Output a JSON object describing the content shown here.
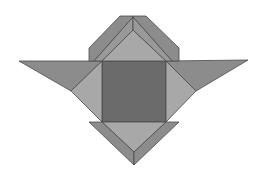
{
  "figure": {
    "type": "geometric-tangram-like-shape",
    "background": "#ffffff",
    "colors": {
      "dark": "#6b6b6b",
      "medium": "#8c8c8c",
      "light": "#a8a8a8",
      "mid_light": "#999999",
      "stroke": "#4a4a4a"
    },
    "pieces": [
      {
        "name": "center-square",
        "fill": "dark",
        "points": "102,61 166,61 166,122 102,122"
      },
      {
        "name": "left-wing",
        "fill": "medium",
        "points": "19,61 102,61 71,91"
      },
      {
        "name": "right-wing",
        "fill": "medium",
        "points": "166,61 248,60 196,91"
      },
      {
        "name": "left-light-triangle",
        "fill": "light",
        "points": "102,61 71,91 102,122"
      },
      {
        "name": "right-light-triangle",
        "fill": "light",
        "points": "166,61 196,91 166,122"
      },
      {
        "name": "top-light-triangle",
        "fill": "light",
        "points": "102,61 133,30 166,61"
      },
      {
        "name": "top-band-left-outer",
        "fill": "medium",
        "points": "89,61 89,48 120,16 133,16 133,17 94,61"
      },
      {
        "name": "top-band-left-inner",
        "fill": "mid_light",
        "points": "94,61 133,17 133,30 102,61"
      },
      {
        "name": "top-band-right-outer",
        "fill": "medium",
        "points": "133,16 146,16 179,48 179,61 172,61 133,17"
      },
      {
        "name": "top-band-right-inner",
        "fill": "mid_light",
        "points": "133,17 172,61 166,61 133,30"
      },
      {
        "name": "bottom-light-triangle",
        "fill": "light",
        "points": "102,122 166,122 134,152"
      },
      {
        "name": "bottom-left-band",
        "fill": "medium",
        "points": "89,122 102,122 134,152 134,165"
      },
      {
        "name": "bottom-right-band",
        "fill": "medium",
        "points": "166,122 179,122 134,165 134,152"
      }
    ]
  }
}
